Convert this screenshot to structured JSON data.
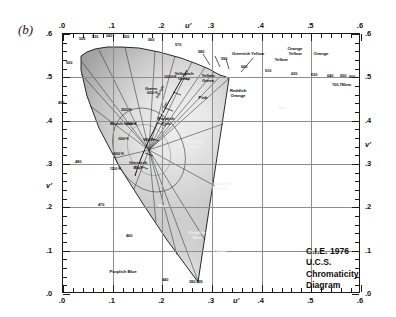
{
  "figure": {
    "panel_label": "(b)",
    "title_lines": [
      "C.I.E. 1976 U.C.S.",
      "Chromaticity",
      "Diagram"
    ]
  },
  "chart_data": {
    "type": "scatter",
    "title": "C.I.E. 1976 U.C.S. Chromaticity Diagram",
    "xlabel": "u'",
    "ylabel": "v'",
    "xlim": [
      0.0,
      0.6
    ],
    "ylim": [
      0.0,
      0.6
    ],
    "grid": true,
    "legend": "none",
    "x_ticks": [
      ".0",
      ".1",
      ".2",
      ".3",
      ".4",
      ".5",
      ".6"
    ],
    "y_ticks": [
      ".0",
      ".1",
      ".2",
      ".3",
      ".4",
      ".5",
      ".6"
    ],
    "x_tick_values": [
      0.0,
      0.1,
      0.2,
      0.3,
      0.4,
      0.5,
      0.6
    ],
    "y_tick_values": [
      0.0,
      0.1,
      0.2,
      0.3,
      0.4,
      0.5,
      0.6
    ],
    "minor_tick_step": 0.02,
    "spectral_locus": {
      "name": "Spectral locus (monochromatic wavelengths, nm)",
      "wavelength_labels": [
        {
          "nm": "520",
          "u": 0.062,
          "v": 0.587
        },
        {
          "nm": "530",
          "u": 0.075,
          "v": 0.586
        },
        {
          "nm": "540",
          "u": 0.092,
          "v": 0.583
        },
        {
          "nm": "550",
          "u": 0.113,
          "v": 0.58
        },
        {
          "nm": "560",
          "u": 0.139,
          "v": 0.576
        },
        {
          "nm": "570",
          "u": 0.169,
          "v": 0.57
        },
        {
          "nm": "580",
          "u": 0.202,
          "v": 0.563
        },
        {
          "nm": "590",
          "u": 0.233,
          "v": 0.555
        },
        {
          "nm": "600",
          "u": 0.261,
          "v": 0.547
        },
        {
          "nm": "610",
          "u": 0.283,
          "v": 0.54
        },
        {
          "nm": "620",
          "u": 0.299,
          "v": 0.535
        },
        {
          "nm": "630",
          "u": 0.311,
          "v": 0.531
        },
        {
          "nm": "640",
          "u": 0.319,
          "v": 0.529
        },
        {
          "nm": "650",
          "u": 0.324,
          "v": 0.527
        },
        {
          "nm": "660",
          "u": 0.328,
          "v": 0.526
        },
        {
          "nm": "700-780nm",
          "u": 0.331,
          "v": 0.525
        },
        {
          "nm": "500",
          "u": 0.035,
          "v": 0.521
        },
        {
          "nm": "490",
          "u": 0.022,
          "v": 0.431
        },
        {
          "nm": "480",
          "u": 0.045,
          "v": 0.296
        },
        {
          "nm": "470",
          "u": 0.096,
          "v": 0.196
        },
        {
          "nm": "460",
          "u": 0.154,
          "v": 0.131
        },
        {
          "nm": "440",
          "u": 0.214,
          "v": 0.081
        },
        {
          "nm": "380-420",
          "u": 0.256,
          "v": 0.016
        }
      ]
    },
    "planckian_locus": {
      "name": "Planckian (blackbody) locus",
      "temperature_labels": [
        "10000°K",
        "6000°K",
        "4000°K",
        "3000°K",
        "2000°K",
        "1500°K"
      ],
      "annotations": [
        "2500°K",
        "Day-light",
        "Sun"
      ]
    },
    "regions": [
      {
        "label": "Green",
        "u": 0.1,
        "v": 0.52
      },
      {
        "label": "Yellowish\nGreen",
        "u": 0.165,
        "v": 0.552
      },
      {
        "label": "Yellow\nGreen",
        "u": 0.212,
        "v": 0.55
      },
      {
        "label": "Greenish Yellow",
        "u": 0.252,
        "v": 0.576
      },
      {
        "label": "Yellow",
        "u": 0.287,
        "v": 0.567
      },
      {
        "label": "Orange\nYellow",
        "u": 0.307,
        "v": 0.585
      },
      {
        "label": "Orange",
        "u": 0.335,
        "v": 0.58
      },
      {
        "label": "Reddish\nOrange",
        "u": 0.361,
        "v": 0.545
      },
      {
        "label": "Red",
        "u": 0.43,
        "v": 0.51
      },
      {
        "label": "Bluish Green",
        "u": 0.083,
        "v": 0.438
      },
      {
        "label": "Greenish\nBlue",
        "u": 0.106,
        "v": 0.343
      },
      {
        "label": "Blue",
        "u": 0.152,
        "v": 0.246
      },
      {
        "label": "Purplish Blue",
        "u": 0.17,
        "v": 0.085
      },
      {
        "label": "Purplish\nBlue",
        "u": 0.272,
        "v": 0.17
      },
      {
        "label": "Purple",
        "u": 0.32,
        "v": 0.132
      },
      {
        "label": "Reddish\nPurple",
        "u": 0.333,
        "v": 0.252
      },
      {
        "label": "Purplish\nRed",
        "u": 0.382,
        "v": 0.39
      },
      {
        "label": "Purplish\nPink",
        "u": 0.31,
        "v": 0.43
      },
      {
        "label": "Pink",
        "u": 0.29,
        "v": 0.47
      },
      {
        "label": "White",
        "u": 0.215,
        "v": 0.43
      }
    ]
  }
}
